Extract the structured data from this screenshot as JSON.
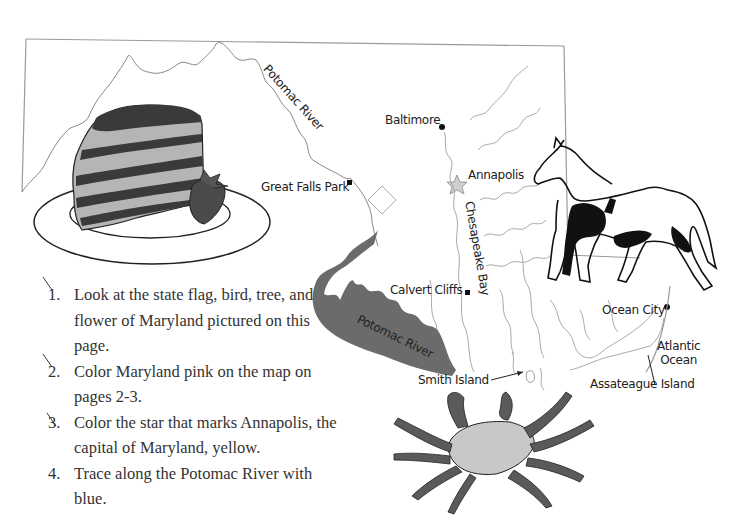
{
  "map": {
    "labels": {
      "potomac_river_north": "Potomac River",
      "baltimore": "Baltimore",
      "great_falls_park": "Great Falls Park",
      "annapolis": "Annapolis",
      "chesapeake_bay": "Chesapeake Bay",
      "calvert_cliffs": "Calvert Cliffs",
      "potomac_river_south": "Potomac River",
      "ocean_city": "Ocean City",
      "atlantic_ocean_line1": "Atlantic",
      "atlantic_ocean_line2": "Ocean",
      "smith_island": "Smith Island",
      "assateague_island": "Assateague Island"
    },
    "illustrations": [
      "cake-slice-with-strawberry",
      "pinto-horse",
      "blue-crab"
    ]
  },
  "instructions": {
    "items": [
      {
        "number": "1.",
        "text": "Look at the state flag, bird, tree, and flower of Maryland pictured on this page.",
        "checked": true
      },
      {
        "number": "2.",
        "text": "Color Maryland pink on the map on pages 2-3.",
        "checked": true
      },
      {
        "number": "3.",
        "text": "Color the star that marks Annapolis, the capital of Maryland, yellow.",
        "checked": true
      },
      {
        "number": "4.",
        "text": "Trace along the Potomac River with blue.",
        "checked": false
      }
    ]
  },
  "colors": {
    "border": "#9a9a9a",
    "river_fill": "#6b6b6b",
    "bay_lines": "#a0a0a0",
    "text": "#333333"
  }
}
